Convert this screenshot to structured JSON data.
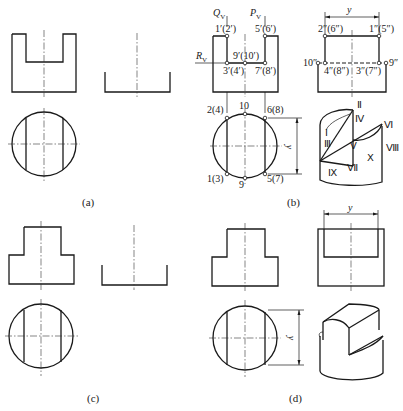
{
  "figure": {
    "captions": {
      "a": "(a)",
      "b": "(b)",
      "c": "(c)",
      "d": "(d)"
    },
    "panel_b": {
      "plane_labels": {
        "q": "Q",
        "q_sub": "V",
        "p": "P",
        "p_sub": "V",
        "r": "R",
        "r_sub": "V"
      },
      "front_view_points": {
        "p1": "1′(2′)",
        "p5": "5′(6′)",
        "p9": "9′(10′)",
        "p3": "3′(4′)",
        "p7": "7′(8′)"
      },
      "side_view_points": {
        "p2": "2″(6″)",
        "p1": "1″(5″)",
        "p10": "10″",
        "p9": "9″",
        "p4": "4″(8″)",
        "p3": "3″(7″)"
      },
      "top_view_points": {
        "p2": "2(4)",
        "p10": "10",
        "p6": "6(8)",
        "p1": "1(3)",
        "p9": "9",
        "p5": "5(7)"
      },
      "dimension_label": "y",
      "iso_labels": {
        "II": "Ⅱ",
        "IV": "Ⅳ",
        "VI": "Ⅵ",
        "I": "Ⅰ",
        "III": "Ⅲ",
        "V": "Ⅴ",
        "X": "Ⅹ",
        "VIII": "Ⅷ",
        "IX": "Ⅸ",
        "VII": "Ⅶ"
      }
    },
    "panel_d": {
      "dimension_label_top": "y",
      "dimension_label_side": "y"
    }
  }
}
